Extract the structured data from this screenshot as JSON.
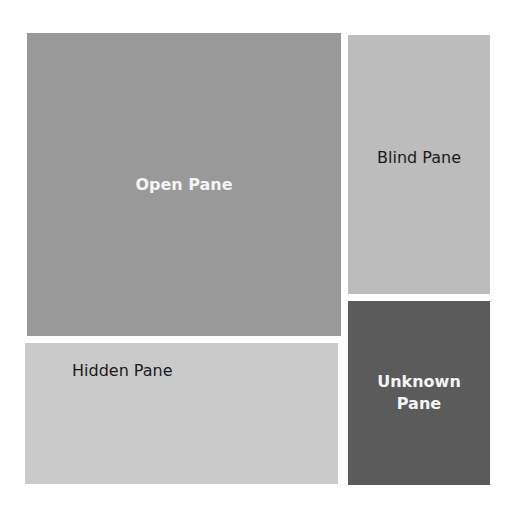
{
  "diagram": {
    "panes": {
      "open": {
        "label": "Open Pane",
        "color": "#999999"
      },
      "blind": {
        "label": "Blind Pane",
        "color": "#bcbcbc"
      },
      "hidden": {
        "label": "Hidden Pane",
        "color": "#cacaca"
      },
      "unknown": {
        "label": "Unknown Pane",
        "line1": "Unknown",
        "line2": "Pane",
        "color": "#5b5b5b"
      }
    }
  }
}
